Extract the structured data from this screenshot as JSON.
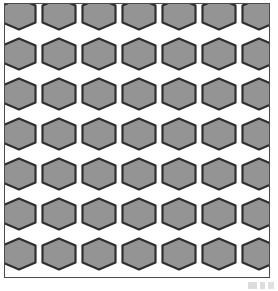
{
  "figure": {
    "kind": "geometric-pattern-plate",
    "width": 278,
    "height": 291
  },
  "frame": {
    "name": "pattern-border",
    "stroke_color": "#4a4a4a",
    "stroke_width": 1.5,
    "background_color": "#ffffff",
    "inset_left": 4,
    "inset_top": 3,
    "inner_width": 266,
    "inner_height": 275
  },
  "pattern": {
    "motif": "hexagon",
    "orientation": "pointy-top",
    "arrangement": "aligned-rows-and-columns",
    "tile_pitch_x": 40,
    "tile_pitch_y": 40,
    "columns_visible": 7,
    "rows_visible": 7,
    "hexagon_fill": "#949494",
    "hexagon_stroke": "#2e2e2e",
    "hexagon_stroke_width": 2.2,
    "channel_fill": "#ffffff",
    "junction_shape": "Y-connector",
    "hexagon_width": 33,
    "hexagon_height": 31
  },
  "artifacts": {
    "scan_smudge_label": "scan-smudge",
    "scan_smudge_color": "#8d8d8d"
  }
}
